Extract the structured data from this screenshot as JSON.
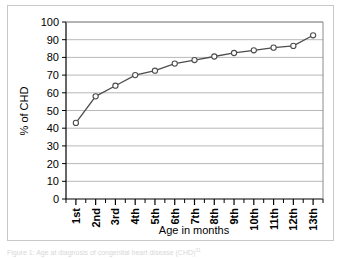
{
  "chart_data": {
    "type": "line",
    "title": "",
    "subtitle": "",
    "xlabel": "Age in months",
    "ylabel": "% of CHD",
    "categories": [
      "1st",
      "2nd",
      "3rd",
      "4th",
      "5th",
      "6th",
      "7th",
      "8th",
      "9th",
      "10th",
      "11th",
      "12th",
      "13th"
    ],
    "values": [
      43,
      58,
      64,
      70,
      72.5,
      76.5,
      78.5,
      80.5,
      82.5,
      84,
      85.5,
      86.5,
      92.5
    ],
    "series": [
      {
        "name": "% of CHD",
        "values": [
          43,
          58,
          64,
          70,
          72.5,
          76.5,
          78.5,
          80.5,
          82.5,
          84,
          85.5,
          86.5,
          92.5
        ]
      }
    ],
    "ylim": [
      0,
      100
    ],
    "yticks": [
      0,
      10,
      20,
      30,
      40,
      50,
      60,
      70,
      80,
      90,
      100
    ],
    "ytick_labels": [
      "0",
      "10",
      "20",
      "30",
      "40",
      "50",
      "60",
      "70",
      "80",
      "90",
      "100"
    ],
    "grid": "horizontal",
    "legend": "none",
    "marker": "open-circle",
    "line_color": "#4d4d4d",
    "marker_fill": "#ffffff",
    "marker_edge": "#4d4d4d",
    "grid_color": "#a6a6a6",
    "axis_color": "#000000",
    "plot_background": "#ffffff",
    "xtick_rotation": -90
  },
  "caption": {
    "text": "Figure 1: Age at diagnosis of congenital heart disease (CHD)",
    "superscript": "31"
  }
}
